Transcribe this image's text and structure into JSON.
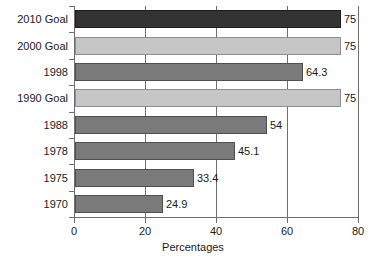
{
  "chart_data": {
    "type": "bar",
    "orientation": "horizontal",
    "title": "",
    "xlabel": "Percentages",
    "ylabel": "",
    "xlim": [
      0,
      80
    ],
    "xticks": [
      0,
      20,
      40,
      60,
      80
    ],
    "grid": true,
    "legend": "none",
    "categories": [
      "2010 Goal",
      "2000 Goal",
      "1998",
      "1990 Goal",
      "1988",
      "1978",
      "1975",
      "1970"
    ],
    "values": [
      75,
      75,
      64.3,
      75,
      54,
      45.1,
      33.4,
      24.9
    ],
    "value_labels": [
      "75",
      "75",
      "64.3",
      "75",
      "54",
      "45.1",
      "33.4",
      "24.9"
    ],
    "bar_colors": [
      "#333333",
      "#c6c6c6",
      "#7a7a7a",
      "#c6c6c6",
      "#7a7a7a",
      "#7a7a7a",
      "#7a7a7a",
      "#7a7a7a"
    ],
    "bar_styles": [
      "dark",
      "light",
      "mid",
      "light",
      "mid",
      "mid",
      "mid",
      "mid"
    ]
  },
  "axis": {
    "x_tick_labels": [
      "0",
      "20",
      "40",
      "60",
      "80"
    ],
    "x_title": "Percentages"
  },
  "colors": {
    "dark_bar": "#333333",
    "mid_bar": "#7a7a7a",
    "light_bar": "#c6c6c6",
    "axis": "#6e6e6e",
    "text": "#1a1a1a",
    "background": "#ffffff"
  }
}
